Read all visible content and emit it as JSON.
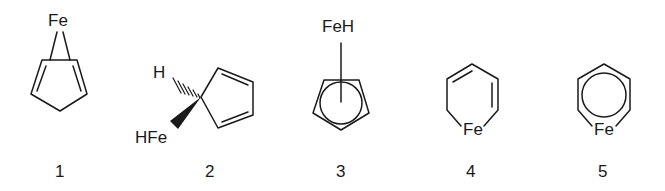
{
  "figure": {
    "structures": [
      {
        "id": "1",
        "label": "1",
        "atoms": [
          "Fe"
        ]
      },
      {
        "id": "2",
        "label": "2",
        "atoms": [
          "H",
          "HFe"
        ]
      },
      {
        "id": "3",
        "label": "3",
        "atoms": [
          "FeH"
        ]
      },
      {
        "id": "4",
        "label": "4",
        "atoms": [
          "Fe"
        ]
      },
      {
        "id": "5",
        "label": "5",
        "atoms": [
          "Fe"
        ]
      }
    ]
  },
  "colors": {
    "ink": "#1a1a1a",
    "background": "#ffffff"
  }
}
